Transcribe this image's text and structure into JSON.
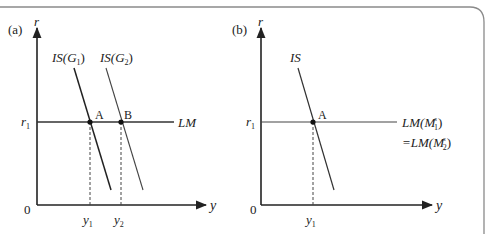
{
  "frame": {
    "border_color": "#8a8a8a"
  },
  "panel_a": {
    "tag": "(a)",
    "y_axis_label": "r",
    "x_axis_label": "y",
    "origin_label": "0",
    "r_level_label": "r",
    "r_level_sub": "1",
    "curves": {
      "is1": {
        "label": "IS(G",
        "sub": "1",
        "close": ")"
      },
      "is2": {
        "label": "IS(G",
        "sub": "2",
        "close": ")"
      },
      "lm": {
        "label": "LM"
      }
    },
    "points": {
      "a": "A",
      "b": "B"
    },
    "x_ticks": [
      {
        "label": "y",
        "sub": "1"
      },
      {
        "label": "y",
        "sub": "2"
      }
    ]
  },
  "panel_b": {
    "tag": "(b)",
    "y_axis_label": "r",
    "x_axis_label": "y",
    "origin_label": "0",
    "r_level_label": "r",
    "r_level_sub": "1",
    "curves": {
      "is": {
        "label": "IS"
      },
      "lm_line1": {
        "pre": "LM(M",
        "sup": "s",
        "sub": "1",
        "close": ")"
      },
      "lm_line2": {
        "pre": "=LM(M",
        "sup": "s",
        "sub": "2",
        "close": ")"
      }
    },
    "points": {
      "a": "A"
    },
    "x_ticks": [
      {
        "label": "y",
        "sub": "1"
      }
    ]
  }
}
